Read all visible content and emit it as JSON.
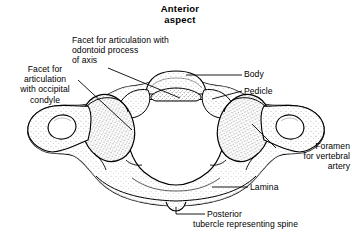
{
  "figure": {
    "title": "Anterior\naspect",
    "background_color": "#ffffff",
    "ink_color": "#000000",
    "stipple_color": "#000000"
  },
  "labels": {
    "facet_odontoid": "Facet for articulation with\nodontoid process\nof axis",
    "facet_occipital": "Facet for\narticulation\nwith occipital\ncondyle",
    "body": "Body",
    "pedicle": "Pedicle",
    "foramen": "Foramen\nfor vertebral\nartery",
    "lamina": "Lamina",
    "posterior_main": "Posterior",
    "posterior_sub": "tubercle representing spine"
  },
  "structures": [
    {
      "name": "anterior-arch-body",
      "label_ref": "body"
    },
    {
      "name": "pedicle",
      "label_ref": "pedicle"
    },
    {
      "name": "facet-for-odontoid-process",
      "label_ref": "facet_odontoid"
    },
    {
      "name": "superior-articular-facet-occipital-condyle",
      "label_ref": "facet_occipital"
    },
    {
      "name": "foramen-transversarium",
      "label_ref": "foramen"
    },
    {
      "name": "lamina-posterior-arch",
      "label_ref": "lamina"
    },
    {
      "name": "posterior-tubercle",
      "label_ref": "posterior_main"
    },
    {
      "name": "vertebral-foramen",
      "label_ref": null
    },
    {
      "name": "transverse-process-left",
      "label_ref": null
    },
    {
      "name": "transverse-process-right",
      "label_ref": null
    }
  ]
}
